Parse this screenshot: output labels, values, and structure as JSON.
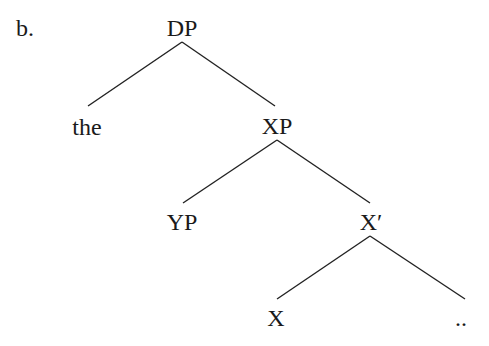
{
  "example_label": "b.",
  "tree": {
    "nodes": [
      {
        "id": "DP",
        "label": "DP"
      },
      {
        "id": "the",
        "label": "the"
      },
      {
        "id": "XP",
        "label": "XP"
      },
      {
        "id": "YP",
        "label": "YP"
      },
      {
        "id": "Xbar",
        "label": "X′"
      },
      {
        "id": "X",
        "label": "X"
      },
      {
        "id": "ellipsis",
        "label": ".."
      }
    ],
    "edges": [
      {
        "from": "DP",
        "to": "the"
      },
      {
        "from": "DP",
        "to": "XP"
      },
      {
        "from": "XP",
        "to": "YP"
      },
      {
        "from": "XP",
        "to": "Xbar"
      },
      {
        "from": "Xbar",
        "to": "X"
      },
      {
        "from": "Xbar",
        "to": "ellipsis"
      }
    ]
  }
}
